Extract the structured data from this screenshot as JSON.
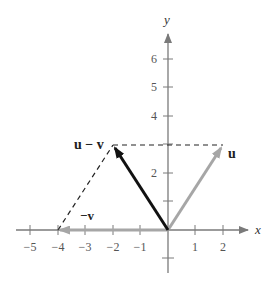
{
  "diagram": {
    "axes": {
      "x_label": "x",
      "y_label": "y",
      "x_ticks": [
        {
          "value": -5,
          "label": "−5"
        },
        {
          "value": -4,
          "label": "−4"
        },
        {
          "value": -3,
          "label": "−3"
        },
        {
          "value": -2,
          "label": "−2"
        },
        {
          "value": -1,
          "label": "−1"
        },
        {
          "value": 1,
          "label": "1"
        },
        {
          "value": 2,
          "label": "2"
        }
      ],
      "y_ticks": [
        {
          "value": 2,
          "label": "2"
        },
        {
          "value": 4,
          "label": "4"
        },
        {
          "value": 5,
          "label": "5"
        },
        {
          "value": 6,
          "label": "6"
        }
      ]
    },
    "vectors": [
      {
        "name": "u",
        "label": "u",
        "from": [
          0,
          0
        ],
        "to": [
          2,
          3
        ],
        "color": "#a6a6a6"
      },
      {
        "name": "-v",
        "label": "−v",
        "from": [
          0,
          0
        ],
        "to": [
          -4,
          0
        ],
        "color": "#a6a6a6"
      },
      {
        "name": "u-v",
        "label": "u − v",
        "from": [
          0,
          0
        ],
        "to": [
          -2,
          3
        ],
        "color": "#111111"
      }
    ],
    "dashed_lines": [
      {
        "from": [
          -2,
          3
        ],
        "to": [
          2,
          3
        ]
      },
      {
        "from": [
          -4,
          0
        ],
        "to": [
          -2,
          3
        ]
      }
    ],
    "colors": {
      "axis": "#7a7a7a",
      "dashed": "#222222",
      "text": "#333333"
    }
  }
}
